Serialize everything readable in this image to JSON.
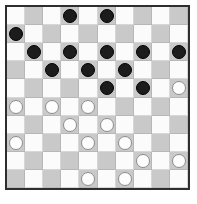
{
  "board": {
    "title": "Draughts board",
    "rows": 10,
    "columns": 10,
    "light_square_color": "#fbfbfb",
    "dark_square_color": "#c9c9c9",
    "frame_color": "#2e2e2e",
    "black_piece_color": "#1c1c1c",
    "white_piece_color": "#fdfdfd",
    "dark_square_rule": "dark when (row + col) is odd",
    "black_piece_count": 13,
    "white_piece_count": 13,
    "total_piece_count": 26,
    "pieces": [
      {
        "row": 0,
        "col": 3,
        "color": "black"
      },
      {
        "row": 0,
        "col": 5,
        "color": "black"
      },
      {
        "row": 1,
        "col": 0,
        "color": "black"
      },
      {
        "row": 2,
        "col": 1,
        "color": "black"
      },
      {
        "row": 2,
        "col": 3,
        "color": "black"
      },
      {
        "row": 2,
        "col": 5,
        "color": "black"
      },
      {
        "row": 2,
        "col": 7,
        "color": "black"
      },
      {
        "row": 2,
        "col": 9,
        "color": "black"
      },
      {
        "row": 3,
        "col": 2,
        "color": "black"
      },
      {
        "row": 3,
        "col": 4,
        "color": "black"
      },
      {
        "row": 3,
        "col": 6,
        "color": "black"
      },
      {
        "row": 4,
        "col": 5,
        "color": "black"
      },
      {
        "row": 4,
        "col": 7,
        "color": "black"
      },
      {
        "row": 4,
        "col": 9,
        "color": "white"
      },
      {
        "row": 5,
        "col": 0,
        "color": "white"
      },
      {
        "row": 5,
        "col": 2,
        "color": "white"
      },
      {
        "row": 5,
        "col": 4,
        "color": "white"
      },
      {
        "row": 6,
        "col": 3,
        "color": "white"
      },
      {
        "row": 6,
        "col": 5,
        "color": "white"
      },
      {
        "row": 7,
        "col": 0,
        "color": "white"
      },
      {
        "row": 7,
        "col": 4,
        "color": "white"
      },
      {
        "row": 7,
        "col": 6,
        "color": "white"
      },
      {
        "row": 8,
        "col": 7,
        "color": "white"
      },
      {
        "row": 8,
        "col": 9,
        "color": "white"
      },
      {
        "row": 9,
        "col": 4,
        "color": "white"
      },
      {
        "row": 9,
        "col": 6,
        "color": "white"
      }
    ]
  }
}
